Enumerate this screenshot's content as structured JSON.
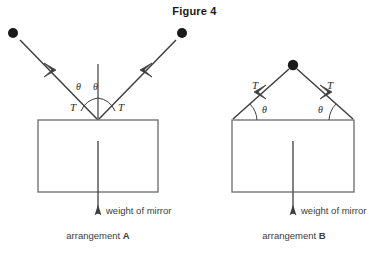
{
  "figure": {
    "title": "Figure 4",
    "colors": {
      "line": "#3f3f3f",
      "mirror_outline": "#6b6b6b",
      "text": "#3c3c3c",
      "dot": "#1a1a1a",
      "background": "#ffffff"
    }
  },
  "arrangement_a": {
    "caption_prefix": "arrangement",
    "caption_letter": "A",
    "weight_label": "weight of mirror",
    "tension_left_label": "T",
    "tension_right_label": "T",
    "angle_left_label": "θ",
    "angle_right_label": "θ",
    "description": "Two strings meet at a single point at the top centre of the mirror; the normal is drawn vertically and each string makes angle theta with the normal."
  },
  "arrangement_b": {
    "caption_prefix": "arrangement",
    "caption_letter": "B",
    "weight_label": "weight of mirror",
    "tension_left_label": "T",
    "tension_right_label": "T",
    "angle_left_label": "θ",
    "angle_right_label": "θ",
    "description": "Two strings run from the top corners of the mirror up to a single point above; each string makes angle theta with the top surface of the mirror."
  }
}
